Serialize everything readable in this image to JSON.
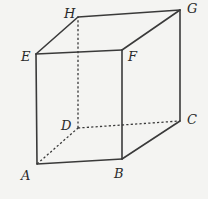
{
  "diagram": {
    "colors": {
      "background": "#f4f4f2",
      "line": "#3a3a3a",
      "text": "#2a2a2a"
    },
    "vertices": {
      "A": {
        "label": "A",
        "x": 37,
        "y": 164,
        "lx": 21,
        "ly": 180
      },
      "B": {
        "label": "B",
        "x": 122,
        "y": 159,
        "lx": 114,
        "ly": 178
      },
      "C": {
        "label": "C",
        "x": 180,
        "y": 121,
        "lx": 187,
        "ly": 124
      },
      "D": {
        "label": "D",
        "x": 78,
        "y": 128,
        "lx": 61,
        "ly": 130
      },
      "E": {
        "label": "E",
        "x": 36,
        "y": 54,
        "lx": 21,
        "ly": 61
      },
      "F": {
        "label": "F",
        "x": 122,
        "y": 50,
        "lx": 128,
        "ly": 61
      },
      "G": {
        "label": "G",
        "x": 180,
        "y": 10,
        "lx": 187,
        "ly": 13
      },
      "H": {
        "label": "H",
        "x": 78,
        "y": 17,
        "lx": 64,
        "ly": 18
      }
    },
    "solid_edges": [
      [
        "A",
        "B"
      ],
      [
        "B",
        "C"
      ],
      [
        "C",
        "G"
      ],
      [
        "G",
        "H"
      ],
      [
        "H",
        "E"
      ],
      [
        "E",
        "A"
      ],
      [
        "E",
        "F"
      ],
      [
        "F",
        "B"
      ],
      [
        "F",
        "G"
      ]
    ],
    "dashed_edges": [
      [
        "A",
        "D"
      ],
      [
        "D",
        "C"
      ],
      [
        "D",
        "H"
      ]
    ]
  }
}
